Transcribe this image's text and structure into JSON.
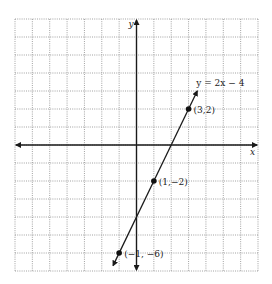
{
  "chart_data": {
    "type": "line",
    "title": "",
    "xlabel": "x",
    "ylabel": "y",
    "xlim": [
      -7,
      7
    ],
    "ylim": [
      -7,
      7
    ],
    "grid": true,
    "grid_style": "dotted",
    "series": [
      {
        "name": "y = 2x − 4",
        "equation_label": "y = 2x − 4",
        "slope": 2,
        "intercept": -4,
        "x_range": [
          -1.35,
          3.5
        ],
        "arrows": "both",
        "points": [
          {
            "x": 3,
            "y": 2,
            "label": "(3,2)"
          },
          {
            "x": 1,
            "y": -2,
            "label": "(1,−2)"
          },
          {
            "x": -1,
            "y": -6,
            "label": "(−1, −6)"
          }
        ]
      }
    ]
  },
  "layout": {
    "grid_left": 15,
    "grid_right": 258,
    "grid_top": 19,
    "grid_bottom": 271,
    "cols": 14,
    "rows": 14,
    "origin_col": 7,
    "origin_row": 7
  }
}
